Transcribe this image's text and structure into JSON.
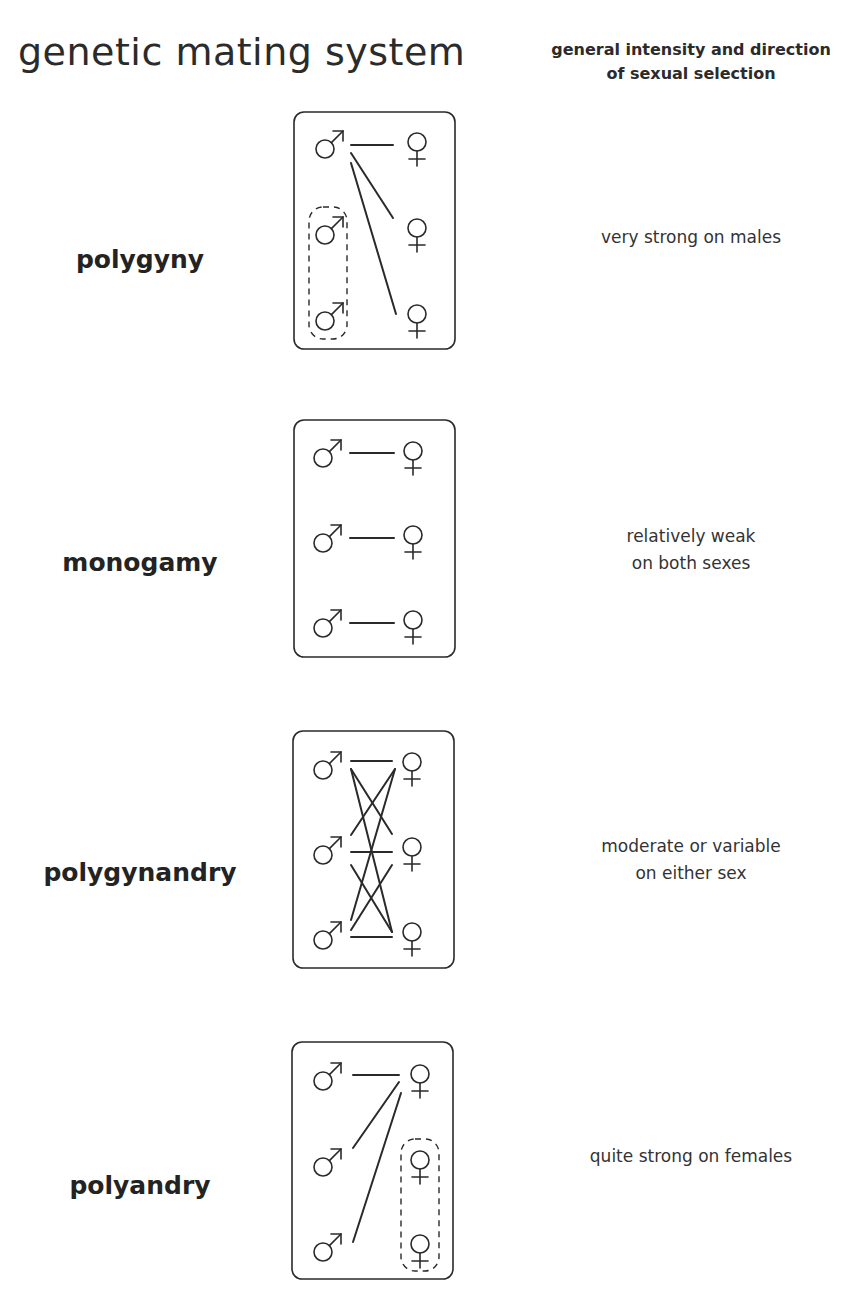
{
  "header": {
    "title": "genetic mating system",
    "right_line1": "general intensity and direction",
    "right_line2": "of sexual selection"
  },
  "systems": [
    {
      "name": "polygyny",
      "description_line1": "very strong on males",
      "description_line2": "",
      "diagram": {
        "males": 3,
        "females": 3,
        "pairings": [
          [
            1,
            1
          ],
          [
            1,
            2
          ],
          [
            1,
            3
          ]
        ],
        "dashed_group": "males 2-3 (unmated)"
      }
    },
    {
      "name": "monogamy",
      "description_line1": "relatively weak",
      "description_line2": "on both sexes",
      "diagram": {
        "males": 3,
        "females": 3,
        "pairings": [
          [
            1,
            1
          ],
          [
            2,
            2
          ],
          [
            3,
            3
          ]
        ],
        "dashed_group": ""
      }
    },
    {
      "name": "polygynandry",
      "description_line1": "moderate or variable",
      "description_line2": "on either sex",
      "diagram": {
        "males": 3,
        "females": 3,
        "pairings": [
          [
            1,
            1
          ],
          [
            1,
            2
          ],
          [
            1,
            3
          ],
          [
            2,
            1
          ],
          [
            2,
            2
          ],
          [
            2,
            3
          ],
          [
            3,
            1
          ],
          [
            3,
            2
          ],
          [
            3,
            3
          ]
        ],
        "dashed_group": ""
      }
    },
    {
      "name": "polyandry",
      "description_line1": "quite strong on females",
      "description_line2": "",
      "diagram": {
        "males": 3,
        "females": 3,
        "pairings": [
          [
            1,
            1
          ],
          [
            2,
            1
          ],
          [
            3,
            1
          ]
        ],
        "dashed_group": "females 2-3 (unmated)"
      }
    }
  ],
  "symbols": {
    "male": "male-symbol",
    "female": "female-symbol"
  },
  "colors": {
    "ink": "#2a2a2a",
    "background": "#ffffff"
  }
}
